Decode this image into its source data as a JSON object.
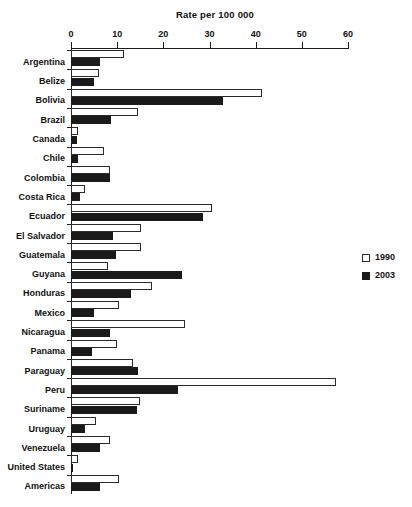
{
  "chart_data": {
    "type": "bar",
    "title": "Rate per 100 000",
    "xlabel": "Rate per 100 000",
    "ylabel": "",
    "orientation": "horizontal",
    "xlim": [
      0,
      60
    ],
    "xticks": [
      0,
      10,
      20,
      30,
      40,
      50,
      60
    ],
    "xtick_labels": [
      "0",
      "10",
      "20",
      "30",
      "40",
      "50",
      "60"
    ],
    "grid": false,
    "legend_position": "right",
    "axis_position": "top",
    "categories": [
      "Argentina",
      "Belize",
      "Bolivia",
      "Brazil",
      "Canada",
      "Chile",
      "Colombia",
      "Costa Rica",
      "Ecuador",
      "El Salvador",
      "Guatemala",
      "Guyana",
      "Honduras",
      "Mexico",
      "Nicaragua",
      "Panama",
      "Paraguay",
      "Peru",
      "Suriname",
      "Uruguay",
      "Venezuela",
      "United States",
      "Americas"
    ],
    "series": [
      {
        "name": "1990",
        "color": "#ffffff",
        "values": [
          11.5,
          6.0,
          41.3,
          14.5,
          1.5,
          7.1,
          8.5,
          3.0,
          30.5,
          15.2,
          15.2,
          8.0,
          17.5,
          10.3,
          24.6,
          10.0,
          13.5,
          57.3,
          15.0,
          5.5,
          8.5,
          1.5,
          10.5
        ]
      },
      {
        "name": "2003",
        "color": "#1a1a1a",
        "values": [
          6.3,
          5.0,
          33.0,
          8.7,
          1.3,
          1.5,
          8.5,
          2.0,
          28.5,
          9.2,
          9.8,
          24.0,
          13.0,
          5.0,
          8.5,
          4.5,
          14.5,
          23.2,
          14.3,
          3.0,
          6.3,
          0.3,
          6.3
        ]
      }
    ]
  },
  "legend": {
    "items": [
      {
        "label": "1990",
        "swatch": "white-square-icon"
      },
      {
        "label": "2003",
        "swatch": "black-square-icon"
      }
    ]
  }
}
